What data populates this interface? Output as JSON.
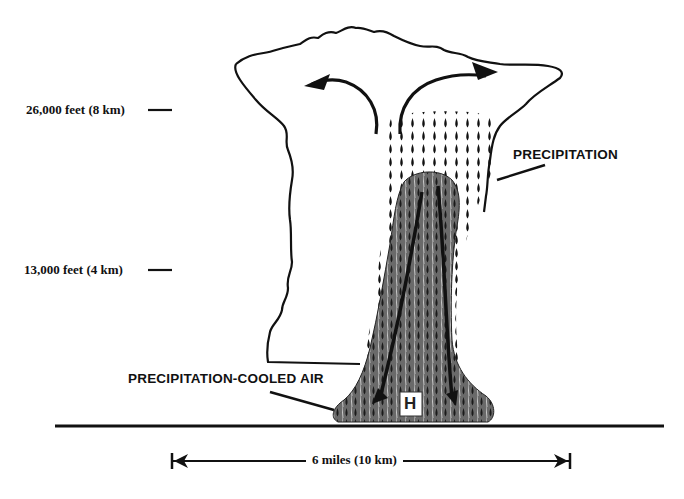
{
  "diagram": {
    "type": "thunderstorm-microburst-cross-section",
    "altitude_labels": [
      {
        "text": "26,000 feet (8 km)"
      },
      {
        "text": "13,000 feet (4 km)"
      }
    ],
    "callouts": {
      "precipitation": "PRECIPITATION",
      "cooled_air": "PRECIPITATION-COOLED AIR"
    },
    "high_pressure_marker": "H",
    "scale": {
      "label": "6 miles (10 km)"
    },
    "colors": {
      "ink": "#111111",
      "downdraft_fill": "#5a5a5a",
      "background": "#ffffff"
    }
  }
}
